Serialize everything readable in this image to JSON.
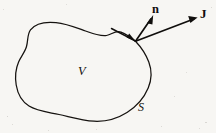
{
  "figure": {
    "kind": "vector-calculus-diagram",
    "background_color": "#f7f6f3",
    "ink_color": "#100e0c",
    "canvas": {
      "width": 216,
      "height": 133
    },
    "labels": {
      "normal_vector": "n",
      "flux_vector": "J",
      "volume": "V",
      "surface": "S"
    },
    "geometry": {
      "surface_outline_path": "M 135.5 41.2 C 141.5 47.5 146.0 54.5 148.8 62.0 C 152.0 70.5 151.8 79.5 148.2 88.0 C 144.0 98.0 136.5 106.5 127.0 112.5 C 117.0 118.8 105.5 121.8 94.0 121.2 C 82.0 120.6 70.5 117.0 59.0 114.5 C 48.0 112.1 37.0 111.0 29.0 106.0 C 21.5 101.3 17.6 93.5 16.2 85.0 C 14.9 77.0 15.6 69.0 18.6 62.0 C 21.0 56.4 25.0 52.0 26.5 46.5 C 28.2 40.3 27.2 34.0 30.5 29.8 C 35.5 23.4 46.0 21.6 56.0 22.6 C 66.5 23.6 76.0 27.6 85.5 31.0 C 93.5 33.9 101.0 36.6 106.5 35.5 C 112.0 34.4 115.5 30.0 121.0 32.2 C 126.5 34.4 131.5 38.0 135.5 41.2 Z",
      "vertex": {
        "x": 135.5,
        "y": 41.2
      },
      "normal_arrow": {
        "x1": 135.5,
        "y1": 41.2,
        "x2": 152.5,
        "y2": 16.5
      },
      "flux_arrow": {
        "x1": 135.5,
        "y1": 41.2,
        "x2": 196.5,
        "y2": 17.8
      },
      "tangent_stub": {
        "x1": 111.5,
        "y1": 28.5,
        "x2": 135.5,
        "y2": 41.2
      }
    }
  }
}
